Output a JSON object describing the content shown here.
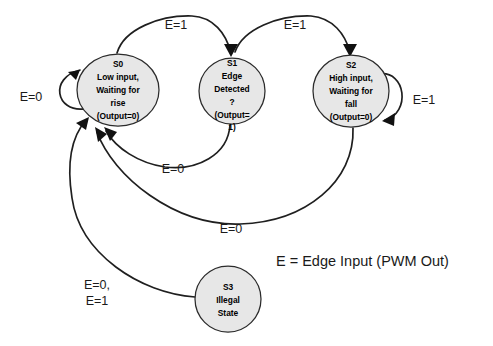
{
  "diagram": {
    "type": "state-diagram",
    "background_color": "#ffffff",
    "node_fill_color": "#e7e7e7",
    "node_stroke_color": "#2b2b2b",
    "edge_color": "#1f1f1f"
  },
  "legend": {
    "text": "E = Edge Input (PWM Out)"
  },
  "states": [
    {
      "id": "S0",
      "name": "state-s0",
      "lines": [
        "S0",
        "Low input,",
        "Waiting for",
        "rise",
        "(Output=0)"
      ],
      "cx": 118,
      "cy": 90,
      "rx": 41,
      "ry": 36
    },
    {
      "id": "S1",
      "name": "state-s1",
      "lines": [
        "S1",
        "Edge",
        "Detected",
        "?",
        "(Output=",
        "1)"
      ],
      "cx": 232,
      "cy": 91,
      "rx": 33,
      "ry": 33
    },
    {
      "id": "S2",
      "name": "state-s2",
      "lines": [
        "S2",
        "High input,",
        "Waiting for",
        "fall",
        "(Output=0)"
      ],
      "cx": 351,
      "cy": 91,
      "rx": 38,
      "ry": 36
    },
    {
      "id": "S3",
      "name": "state-s3",
      "lines": [
        "S3",
        "Illegal",
        "State"
      ],
      "cx": 228,
      "cy": 299,
      "rx": 33,
      "ry": 33
    }
  ],
  "transitions": [
    {
      "name": "transition-s0-self-loop",
      "from": "S0",
      "to": "S0",
      "label": "E=0",
      "label_x": 31,
      "label_y": 98
    },
    {
      "name": "transition-s0-to-s1",
      "from": "S0",
      "to": "S1",
      "label": "E=1",
      "label_x": 176,
      "label_y": 26
    },
    {
      "name": "transition-s1-to-s2",
      "from": "S1",
      "to": "S2",
      "label": "E=1",
      "label_x": 295,
      "label_y": 26
    },
    {
      "name": "transition-s2-self-loop",
      "from": "S2",
      "to": "S2",
      "label": "E=1",
      "label_x": 424,
      "label_y": 101
    },
    {
      "name": "transition-s1-to-s0",
      "from": "S1",
      "to": "S0",
      "label": "E=0",
      "label_x": 173,
      "label_y": 170
    },
    {
      "name": "transition-s2-to-s0",
      "from": "S2",
      "to": "S0",
      "label": "E=0",
      "label_x": 231,
      "label_y": 230
    },
    {
      "name": "transition-s3-to-s0",
      "from": "S3",
      "to": "S0",
      "label_line1": "E=0,",
      "label_line2": "E=1",
      "label_x": 97,
      "label_y": 286
    }
  ]
}
